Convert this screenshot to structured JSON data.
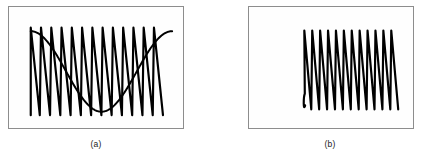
{
  "figure": {
    "background_color": "#ffffff",
    "frame_color": "#8d8d8d",
    "trace_color": "#000000",
    "panel_fill": "#fefefe"
  },
  "panels": [
    {
      "id": "a",
      "caption": "(a)",
      "frame": {
        "x": 8,
        "y": 6,
        "width": 176,
        "height": 123
      }
    },
    {
      "id": "b",
      "caption": "(b)",
      "frame": {
        "x": 248,
        "y": 6,
        "width": 166,
        "height": 123
      }
    }
  ],
  "chart_data": [
    {
      "type": "line",
      "id": "panel-a",
      "title": "(a)",
      "xlabel": "",
      "ylabel": "",
      "grid": false,
      "legend": null,
      "axis_visible": false,
      "xlim": [
        0,
        1
      ],
      "ylim": [
        -1.15,
        1.15
      ],
      "series": [
        {
          "name": "sampled-sawtooth",
          "waveform": "sawtooth",
          "cycles": 13,
          "amplitude": 1.0,
          "line_width": 2.2,
          "color": "#000000",
          "description": "High-frequency rising sawtooth spanning the panel width"
        },
        {
          "name": "aliased-envelope",
          "waveform": "sine",
          "cycles": 1,
          "phase_deg": 90,
          "amplitude": 0.92,
          "line_width": 2.0,
          "color": "#000000",
          "description": "Slow aliased sine component starting high, dipping to minimum near one third, rising to maximum near three quarters, then falling"
        }
      ]
    },
    {
      "type": "line",
      "id": "panel-b",
      "title": "(b)",
      "xlabel": "",
      "ylabel": "",
      "grid": false,
      "legend": null,
      "axis_visible": false,
      "xlim": [
        0,
        1
      ],
      "ylim": [
        -1.15,
        1.15
      ],
      "series": [
        {
          "name": "sampled-sawtooth",
          "waveform": "sawtooth",
          "cycles": 12,
          "amplitude": 1.0,
          "line_width": 2.2,
          "color": "#000000",
          "description": "High-frequency rising sawtooth with curved lead-in hook at the left"
        }
      ]
    }
  ]
}
